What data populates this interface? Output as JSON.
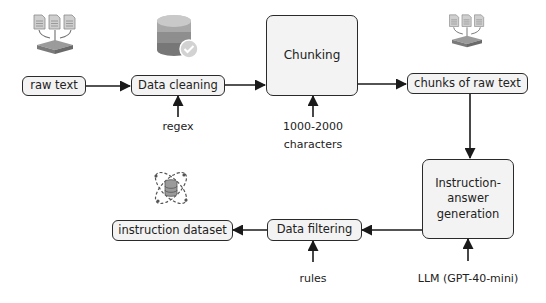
{
  "diagram": {
    "type": "pipeline-flowchart",
    "nodes": {
      "raw_text": "raw text",
      "data_cleaning": "Data cleaning",
      "chunking": "Chunking",
      "chunks_of_raw_text": "chunks of raw text",
      "instruction_answer_generation": [
        "Instruction-",
        "answer",
        "generation"
      ],
      "data_filtering": "Data filtering",
      "instruction_dataset": "instruction dataset"
    },
    "inputs": {
      "regex": "regex",
      "chunk_size": [
        "1000-2000",
        "characters"
      ],
      "rules": "rules",
      "llm": "LLM (GPT-40-mini)"
    },
    "icons": {
      "raw_text": "documents-merge-icon",
      "data_cleaning": "database-check-icon",
      "chunks_of_raw_text": "documents-merge-icon",
      "instruction_dataset": "database-orbit-icon"
    },
    "edges": [
      [
        "raw text",
        "Data cleaning"
      ],
      [
        "Data cleaning",
        "Chunking"
      ],
      [
        "Chunking",
        "chunks of raw text"
      ],
      [
        "chunks of raw text",
        "Instruction-answer generation"
      ],
      [
        "Instruction-answer generation",
        "Data filtering"
      ],
      [
        "Data filtering",
        "instruction dataset"
      ],
      [
        "regex",
        "Data cleaning"
      ],
      [
        "1000-2000 characters",
        "Chunking"
      ],
      [
        "rules",
        "Data filtering"
      ],
      [
        "LLM (GPT-40-mini)",
        "Instruction-answer generation"
      ]
    ],
    "colors": {
      "box_fill": "#f3f3f3",
      "stroke": "#2a2a2a",
      "icon_gray": "#9a9a9a"
    }
  }
}
